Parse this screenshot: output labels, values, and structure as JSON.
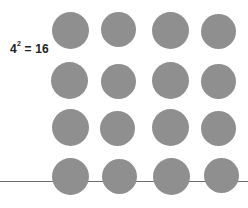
{
  "label": {
    "base": "4",
    "exponent": "2",
    "rest": " = 16"
  },
  "grid": {
    "rows": 4,
    "cols": 4,
    "count": 16,
    "dot_color": "#8f8f8f",
    "line_color": "#6e6e6e",
    "dots": [
      {
        "cx": 70,
        "cy": 30,
        "d": 37
      },
      {
        "cx": 118,
        "cy": 29,
        "d": 35
      },
      {
        "cx": 170,
        "cy": 30,
        "d": 37
      },
      {
        "cx": 218,
        "cy": 31,
        "d": 35
      },
      {
        "cx": 69,
        "cy": 80,
        "d": 37
      },
      {
        "cx": 118,
        "cy": 81,
        "d": 35
      },
      {
        "cx": 170,
        "cy": 80,
        "d": 37
      },
      {
        "cx": 218,
        "cy": 81,
        "d": 35
      },
      {
        "cx": 70,
        "cy": 127,
        "d": 37
      },
      {
        "cx": 117,
        "cy": 128,
        "d": 35
      },
      {
        "cx": 170,
        "cy": 127,
        "d": 37
      },
      {
        "cx": 218,
        "cy": 128,
        "d": 35
      },
      {
        "cx": 70,
        "cy": 176,
        "d": 37
      },
      {
        "cx": 119,
        "cy": 176,
        "d": 35
      },
      {
        "cx": 171,
        "cy": 176,
        "d": 37
      },
      {
        "cx": 221,
        "cy": 175,
        "d": 35
      }
    ]
  }
}
